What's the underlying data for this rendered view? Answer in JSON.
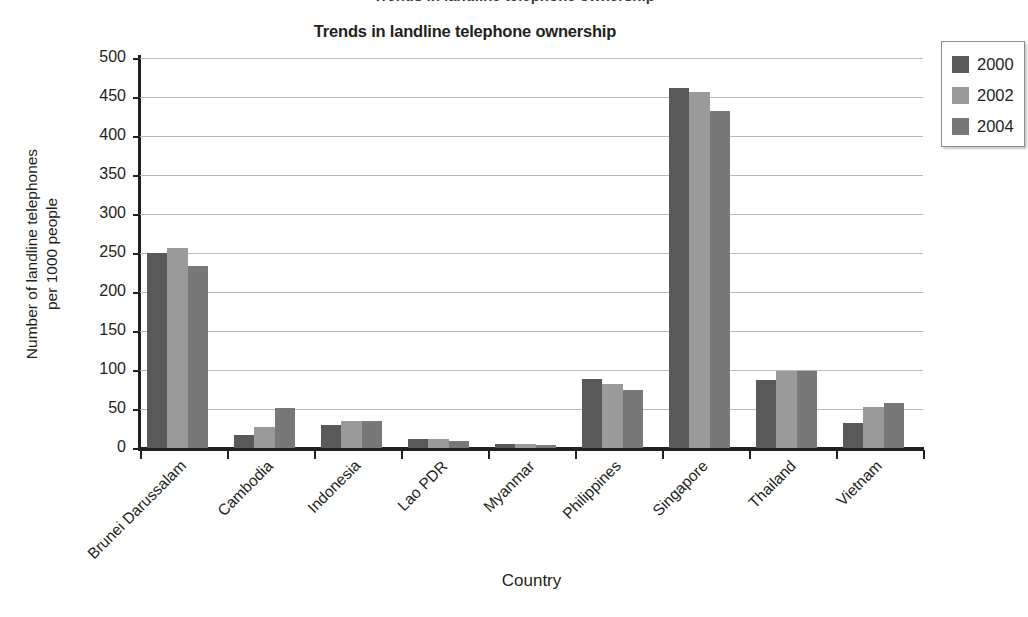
{
  "page": {
    "clipped_top_text": "Trends in landline telephone ownership",
    "background": "#ffffff"
  },
  "chart_data": {
    "type": "bar",
    "title": "Trends in landline telephone ownership",
    "xlabel": "Country",
    "ylabel": "Number of landline telephones per 1000 people",
    "ylabel_line1": "Number of landline telephones",
    "ylabel_line2": "per 1000 people",
    "ylim": [
      0,
      500
    ],
    "ytick_step": 50,
    "yticks": [
      0,
      50,
      100,
      150,
      200,
      250,
      300,
      350,
      400,
      450,
      500
    ],
    "grid": true,
    "grid_axis": "y",
    "legend_position": "outside-right-top",
    "categories": [
      "Brunei Darussalam",
      "Cambodia",
      "Indonesia",
      "Lao PDR",
      "Myanmar",
      "Philippines",
      "Singapore",
      "Thailand",
      "Vietnam"
    ],
    "series": [
      {
        "name": "2000",
        "color": "#595959",
        "values": [
          250,
          17,
          29,
          12,
          5,
          89,
          462,
          87,
          32
        ]
      },
      {
        "name": "2002",
        "color": "#9a9a9a",
        "values": [
          256,
          27,
          35,
          12,
          5,
          82,
          457,
          99,
          52
        ]
      },
      {
        "name": "2004",
        "color": "#787878",
        "values": [
          233,
          51,
          35,
          9,
          4,
          74,
          432,
          99,
          58
        ]
      }
    ]
  },
  "legend": {
    "entries": [
      {
        "label": "2000",
        "color": "#595959"
      },
      {
        "label": "2002",
        "color": "#9a9a9a"
      },
      {
        "label": "2004",
        "color": "#787878"
      }
    ]
  },
  "colors": {
    "axis": "#231f20",
    "gridline": "#b9b9b9",
    "text": "#231f20",
    "legend_border": "#8d8d8d"
  }
}
